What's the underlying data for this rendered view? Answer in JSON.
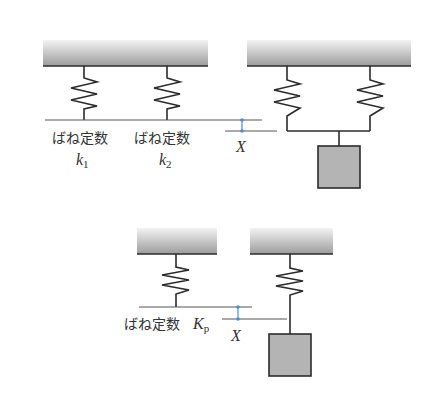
{
  "figure": {
    "top_left": {
      "spring1_label": "ばね定数",
      "spring1_symbol": "k",
      "spring1_subscript": "1",
      "spring2_label": "ばね定数",
      "spring2_symbol": "k",
      "spring2_subscript": "2",
      "displacement_label": "X"
    },
    "bottom": {
      "spring_label": "ばね定数",
      "spring_symbol": "K",
      "spring_subscript": "p",
      "displacement_label": "X"
    },
    "colors": {
      "line": "#2b2b2b",
      "ceiling_top": "#f0f0f0",
      "ceiling_bottom": "#9a9a9a",
      "mass_fill": "#b4b4b4",
      "marker": "#4a8fd0",
      "reference_line": "#555555"
    }
  }
}
